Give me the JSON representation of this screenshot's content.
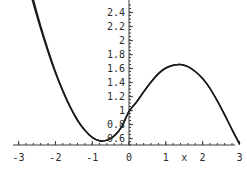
{
  "chart_data": {
    "type": "line",
    "title": "",
    "xlabel": "x",
    "ylabel": "",
    "grid": false,
    "legend": false,
    "xlim": [
      -3,
      3
    ],
    "ylim": [
      0.51,
      2.52
    ],
    "x_ticks": [
      "-3",
      "-2",
      "-1",
      "0",
      "1",
      "2",
      "3"
    ],
    "x_tick_values": [
      -3,
      -2,
      -1,
      0,
      1,
      2,
      3
    ],
    "x_minor_tick_step": 0.2,
    "y_ticks": [
      "0.6",
      "0.8",
      "1",
      "1.2",
      "1.4",
      "1.6",
      "1.8",
      "2",
      "2.2",
      "2.4"
    ],
    "y_tick_values": [
      0.6,
      0.8,
      1,
      1.2,
      1.4,
      1.6,
      1.8,
      2,
      2.2,
      2.4
    ],
    "y_minor_tick_step": 0.05,
    "axis_color": "#3a3a3a",
    "curve_color": "#1a1a1a",
    "series": [
      {
        "name": "curve-1",
        "x": [
          -3.0,
          -2.8,
          -2.6,
          -2.4,
          -2.2,
          -2.0,
          -1.8,
          -1.6,
          -1.4,
          -1.2,
          -1.0,
          -0.8,
          -0.6,
          -0.4,
          -0.2,
          0.0,
          0.2,
          0.4,
          0.6,
          0.8,
          1.0,
          1.2,
          1.4,
          1.6,
          1.8,
          2.0,
          2.2,
          2.4,
          2.6,
          2.8,
          3.0
        ],
        "y": [
          3.45,
          3.0,
          2.59,
          2.21,
          1.87,
          1.56,
          1.29,
          1.06,
          0.87,
          0.72,
          0.62,
          0.57,
          0.58,
          0.64,
          0.77,
          0.99,
          1.12,
          1.27,
          1.41,
          1.53,
          1.61,
          1.65,
          1.66,
          1.63,
          1.56,
          1.46,
          1.32,
          1.14,
          0.94,
          0.73,
          0.53
        ]
      },
      {
        "name": "curve-2",
        "x": [
          -3.0,
          -2.8,
          -2.6,
          -2.4,
          -2.2,
          -2.0,
          -1.8,
          -1.6,
          -1.4,
          -1.2,
          -1.0,
          -0.8,
          -0.6,
          -0.4,
          -0.2,
          0.0,
          0.2,
          0.4,
          0.6,
          0.8,
          1.0,
          1.2,
          1.4,
          1.6,
          1.8,
          2.0,
          2.2,
          2.4,
          2.6,
          2.8,
          3.0
        ],
        "y": [
          3.3,
          2.9,
          2.53,
          2.17,
          1.84,
          1.54,
          1.28,
          1.05,
          0.86,
          0.72,
          0.62,
          0.57,
          0.58,
          0.64,
          0.77,
          0.99,
          1.12,
          1.27,
          1.41,
          1.53,
          1.61,
          1.65,
          1.66,
          1.63,
          1.56,
          1.46,
          1.32,
          1.14,
          0.94,
          0.73,
          0.53
        ]
      }
    ],
    "annotations": {
      "local_minimum": {
        "x": -1.2,
        "y": 0.52
      },
      "y_intercept": {
        "x": 0,
        "y": 1.0
      },
      "local_maximum": {
        "x": 1.4,
        "y": 1.66
      }
    }
  },
  "geometry": {
    "x_axis_pixel_y": 145,
    "y_axis_pixel_x": 129,
    "x_pixels_per_unit": 36.8,
    "y_pixels_per_unit": 70.0,
    "plot_left": 13,
    "plot_right": 235,
    "plot_top": 0,
    "plot_bottom": 145
  }
}
